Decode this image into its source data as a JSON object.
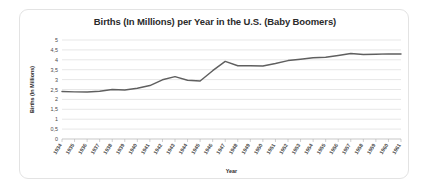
{
  "chart_data": {
    "type": "line",
    "title": "Births (In Millions) per Year in the U.S. (Baby Boomers)",
    "xlabel": "Year",
    "ylabel": "Births (In Millions)",
    "ylim": [
      0,
      5
    ],
    "ytick_labels": [
      "5",
      "4,5",
      "4",
      "3,5",
      "3",
      "2,5",
      "2",
      "1,5",
      "1",
      "0,5",
      "0"
    ],
    "ytick_values": [
      5,
      4.5,
      4,
      3.5,
      3,
      2.5,
      2,
      1.5,
      1,
      0.5,
      0
    ],
    "grid": true,
    "legend": "none",
    "line_color": "#5f5f5f",
    "categories": [
      "1934",
      "1935",
      "1936",
      "1937",
      "1938",
      "1939",
      "1940",
      "1941",
      "1942",
      "1943",
      "1944",
      "1945",
      "1946",
      "1947",
      "1948",
      "1949",
      "1950",
      "1951",
      "1952",
      "1953",
      "1954",
      "1955",
      "1956",
      "1957",
      "1958",
      "1959",
      "1960",
      "1961"
    ],
    "values": [
      2.4,
      2.38,
      2.37,
      2.41,
      2.5,
      2.47,
      2.56,
      2.7,
      2.99,
      3.15,
      2.97,
      2.93,
      3.45,
      3.92,
      3.7,
      3.7,
      3.69,
      3.81,
      3.96,
      4.03,
      4.1,
      4.13,
      4.22,
      4.32,
      4.27,
      4.28,
      4.3,
      4.29
    ]
  }
}
